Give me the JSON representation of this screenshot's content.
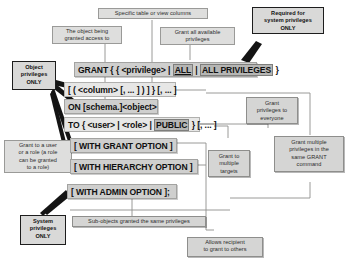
{
  "diagram": {
    "colors": {
      "note_bg": "#dededd",
      "note_border": "#9a9a98",
      "syntax_bg": "#cfcfce",
      "highlight_bg": "#b6b6b4",
      "strong_border": "#1d1d1d"
    }
  },
  "syntax": {
    "line_grant": {
      "keyword": "GRANT",
      "open_braces": "{ {",
      "privilege": "<privilege>",
      "pipe1": "|",
      "all": "ALL",
      "pipe2": "|",
      "all_privileges": "ALL PRIVILEGES",
      "close_brace": "}"
    },
    "line_column": {
      "text": "[ ( <column> [, ... ] ) ] } [, ... ]"
    },
    "line_on": {
      "text": "ON [schema.]<object>"
    },
    "line_to": {
      "keyword": "TO",
      "open_brace": "{",
      "user": "<user>",
      "pipe1": "|",
      "role": "<role>",
      "pipe2": "|",
      "public": "PUBLIC",
      "close": "} [, ... ]"
    },
    "line_grant_option": {
      "text": "[ WITH GRANT OPTION ]"
    },
    "line_hierarchy_option": {
      "text": "[ WITH HIERARCHY OPTION ]"
    },
    "line_admin_option": {
      "text": "[ WITH ADMIN OPTION ];"
    }
  },
  "notes": {
    "specific_columns": "Specific table or view columns",
    "object_being_granted": "The object being\ngranted access to",
    "grant_all_available": "Grant all available\nprivileges",
    "required_system": "Required for\nsystem privileges\nONLY",
    "object_privileges_only": "Object\nprivileges\nONLY",
    "grant_to_user_or_role": "Grant to a user\nor a role (a role\ncan be granted\nto a role)",
    "system_privileges_only": "System\nprivileges\nONLY",
    "grant_to_everyone": "Grant\nprivileges to\neveryone",
    "grant_multiple_targets": "Grant to\nmultiple\ntargets",
    "grant_multiple_privileges": "Grant multiple\nprivileges in the\nsame GRANT\ncommand",
    "sub_objects": "Sub-objects granted the same privileges",
    "allows_recipient": "Allows recipient\nto grant to others"
  }
}
